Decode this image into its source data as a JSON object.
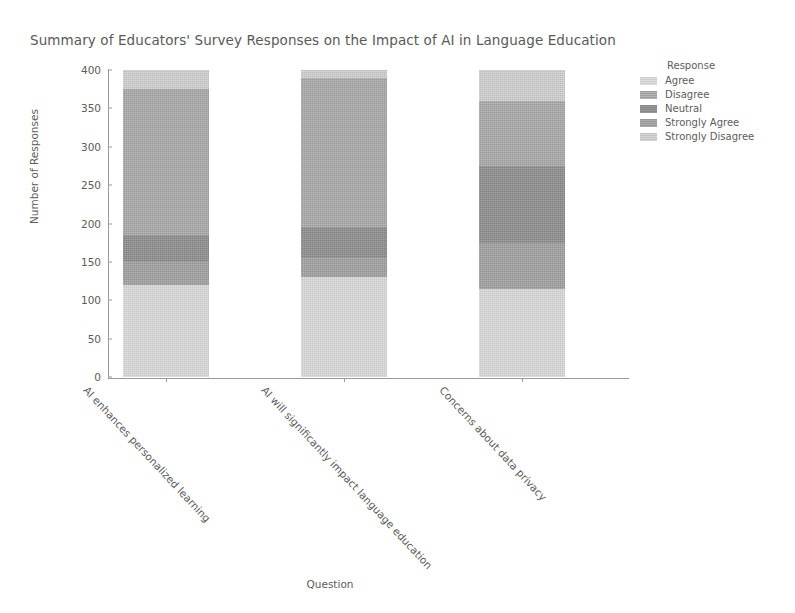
{
  "chart_data": {
    "type": "bar",
    "subtype": "stacked-vertical",
    "title": "Summary of Educators' Survey Responses on the Impact of AI in Language Education",
    "xlabel": "Question",
    "ylabel": "Number of Responses",
    "ylim": [
      0,
      400
    ],
    "yticks": [
      0,
      50,
      100,
      150,
      200,
      250,
      300,
      350,
      400
    ],
    "grid": false,
    "legend_title": "Response",
    "legend_position": "right",
    "categories": [
      "AI enhances personalized learning",
      "AI will significantly impact language education",
      "Concerns about data privacy"
    ],
    "series": [
      {
        "name": "Agree",
        "color": "#d9d9d9",
        "values": [
          120,
          130,
          115
        ]
      },
      {
        "name": "Disagree",
        "color": "#a8a8a8",
        "values": [
          190,
          195,
          85
        ]
      },
      {
        "name": "Neutral",
        "color": "#8c8c8c",
        "values": [
          35,
          40,
          100
        ]
      },
      {
        "name": "Strongly Agree",
        "color": "#9f9f9f",
        "values": [
          30,
          25,
          60
        ]
      },
      {
        "name": "Strongly Disagree",
        "color": "#cfcfcf",
        "values": [
          25,
          10,
          40
        ]
      }
    ],
    "stack_order_bottom_to_top": [
      "Agree",
      "Strongly Agree",
      "Neutral",
      "Disagree",
      "Strongly Disagree"
    ],
    "totals": [
      400,
      400,
      400
    ]
  },
  "axis": {
    "y_tick_labels": [
      "400",
      "350",
      "300",
      "250",
      "200",
      "150",
      "100",
      "50",
      "0"
    ],
    "y_title": "Number of Responses",
    "x_title": "Question"
  },
  "legend": {
    "title": "Response",
    "items": [
      {
        "label": "Agree"
      },
      {
        "label": "Disagree"
      },
      {
        "label": "Neutral"
      },
      {
        "label": "Strongly Agree"
      },
      {
        "label": "Strongly Disagree"
      }
    ]
  },
  "title": "Summary of Educators' Survey Responses on the Impact of AI in Language Education"
}
